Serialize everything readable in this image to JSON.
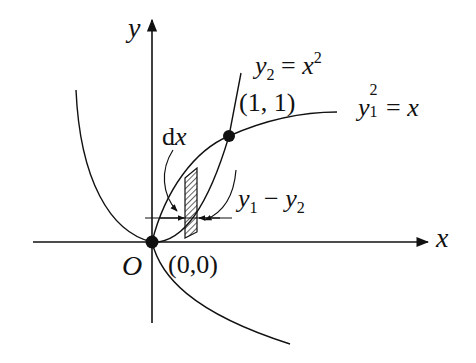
{
  "diagram": {
    "type": "coordinate-plot",
    "axes": {
      "x_label": "x",
      "y_label": "y",
      "origin_label": "O",
      "origin_coord_label": "(0,0)"
    },
    "curves": [
      {
        "name": "y2",
        "equation_var": "y",
        "equation_sub": "2",
        "equation_rhs_var": "x",
        "equation_rhs_sup": "2",
        "equation": "y2 = x^2"
      },
      {
        "name": "y1",
        "equation_var": "y",
        "equation_sub": "1",
        "equation_sup": "2",
        "equation_rhs_var": "x",
        "equation": "y1^2 = x"
      }
    ],
    "points": [
      {
        "label": "(1, 1)",
        "x": 1,
        "y": 1
      },
      {
        "label": "(0,0)",
        "x": 0,
        "y": 0
      }
    ],
    "strip": {
      "width_label_d": "d",
      "width_label_x": "x",
      "height_label": "y1 - y2",
      "height_label_parts": {
        "a": "y",
        "a_sub": "1",
        "minus": "−",
        "b": "y",
        "b_sub": "2"
      }
    },
    "colors": {
      "ink": "#111111",
      "background": "#ffffff"
    }
  }
}
